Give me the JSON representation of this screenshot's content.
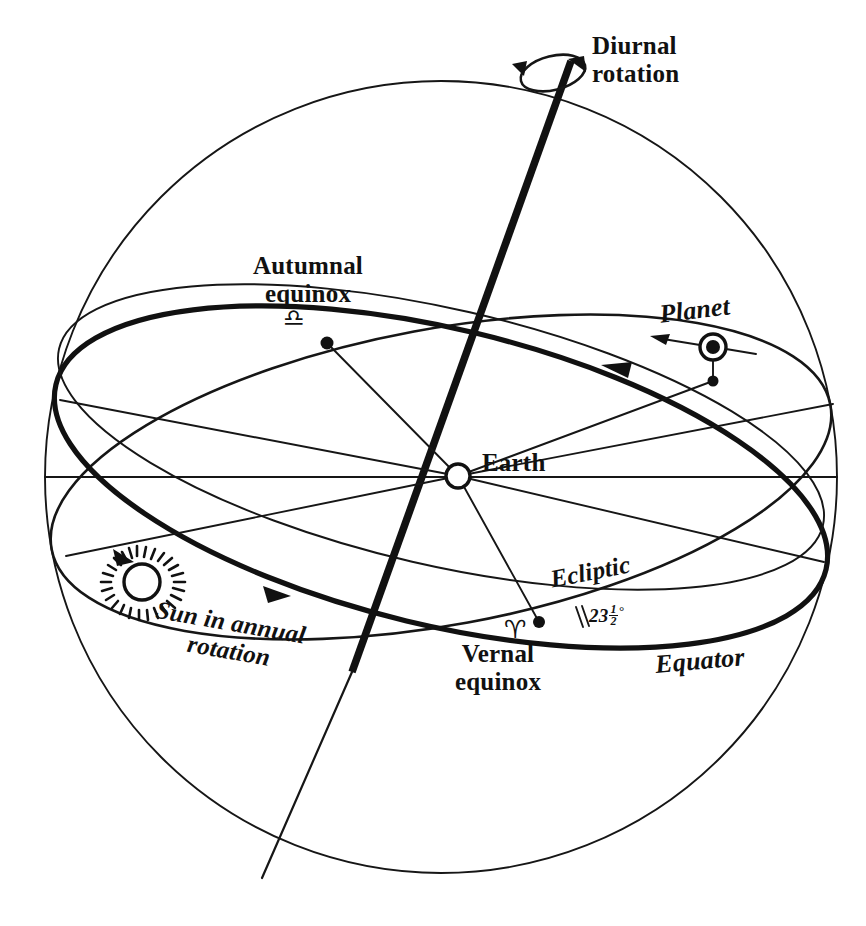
{
  "figure": {
    "kind": "celestial-sphere-diagram",
    "title_visible": "",
    "background_color": "#ffffff",
    "ink_color": "#111111",
    "width": 866,
    "height": 926
  },
  "labels": {
    "diurnal_line1": "Diurnal",
    "diurnal_line2": "rotation",
    "autumnal_line1": "Autumnal",
    "autumnal_line2": "equinox",
    "autumnal_glyph": "♎",
    "autumnal_glyph_name": "libra-symbol",
    "planet": "Planet",
    "earth": "Earth",
    "sun_line1": "Sun in annual",
    "sun_line2": "rotation",
    "ecliptic": "Ecliptic",
    "equator": "Equator",
    "vernal_line1": "Vernal",
    "vernal_line2": "equinox",
    "vernal_glyph": "♈",
    "vernal_glyph_name": "aries-symbol",
    "obliquity_whole": "23",
    "obliquity_numerator": "1",
    "obliquity_denominator": "2",
    "obliquity_degree": "°",
    "obliquity_full": "23½°"
  },
  "geometry": {
    "sphere": {
      "cx": 441,
      "cy": 477,
      "r": 397
    },
    "earth": {
      "cx": 458,
      "cy": 476,
      "r": 13
    },
    "sun": {
      "cx": 137,
      "cy": 580,
      "r": 18,
      "ray_count": 24
    },
    "planet": {
      "cx": 713,
      "cy": 347,
      "r_outer": 13,
      "r_inner": 7
    },
    "planet_foot": {
      "cx": 713,
      "cy": 381
    },
    "vernal_point": {
      "cx": 539,
      "cy": 622
    },
    "autumnal_point": {
      "cx": 327,
      "cy": 343
    },
    "axis_top": {
      "x": 566,
      "y": 57
    },
    "axis_bottom": {
      "x": 262,
      "y": 878
    },
    "obliquity_degrees": 23.5
  }
}
